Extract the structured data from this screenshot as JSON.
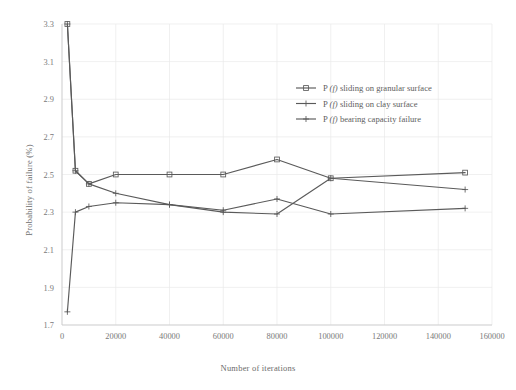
{
  "chart_data": {
    "type": "line",
    "title": "",
    "xlabel": "Number of iterations",
    "ylabel": "Probability of failure (%)",
    "xlim": [
      0,
      160000
    ],
    "ylim": [
      1.7,
      3.3
    ],
    "xticks": [
      0,
      20000,
      40000,
      60000,
      80000,
      100000,
      120000,
      140000,
      160000
    ],
    "xticklabels": [
      "0",
      "20000",
      "40000",
      "60000",
      "80000",
      "100000",
      "120000",
      "140000",
      "160000"
    ],
    "yticks": [
      1.7,
      1.9,
      2.1,
      2.3,
      2.5,
      2.7,
      2.9,
      3.1,
      3.3
    ],
    "yticklabels": [
      "1.7",
      "1.9",
      "2.1",
      "2.3",
      "2.5",
      "2.7",
      "2.9",
      "3.1",
      "3.3"
    ],
    "grid": true,
    "legend_position": "upper right",
    "x": [
      2000,
      5000,
      10000,
      20000,
      40000,
      60000,
      80000,
      100000,
      150000
    ],
    "series": [
      {
        "name": "P (f) sliding on granular surface",
        "marker": "square",
        "color": "#5a5a5a",
        "values": [
          3.3,
          2.52,
          2.45,
          2.5,
          2.5,
          2.5,
          2.58,
          2.48,
          2.51
        ]
      },
      {
        "name": "P (f) sliding on clay surface",
        "marker": "plus",
        "color": "#5a5a5a",
        "values": [
          3.3,
          2.52,
          2.45,
          2.4,
          2.34,
          2.3,
          2.29,
          2.48,
          2.42
        ]
      },
      {
        "name": "P (f) bearing capacity failure",
        "marker": "plus",
        "color": "#5a5a5a",
        "values": [
          1.77,
          2.3,
          2.33,
          2.35,
          2.34,
          2.31,
          2.37,
          2.29,
          2.32
        ]
      }
    ]
  },
  "legend": {
    "entries": [
      {
        "prefix": "P",
        "italic": "(f)",
        "label": "sliding on granular surface"
      },
      {
        "prefix": "P",
        "italic": "(f)",
        "label": "sliding on clay surface"
      },
      {
        "prefix": "P",
        "italic": "(f)",
        "label": "bearing capacity failure"
      }
    ]
  }
}
